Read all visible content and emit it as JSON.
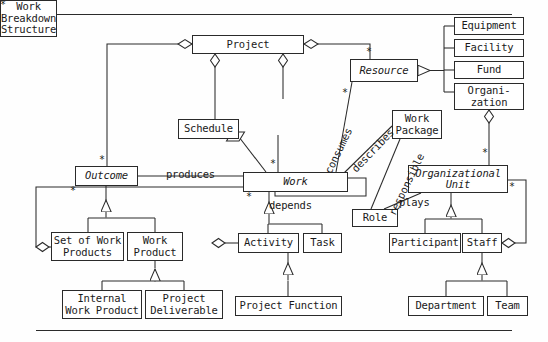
{
  "diagram": {
    "type": "uml-class-diagram",
    "classes": [
      {
        "id": "project",
        "label": "Project",
        "abstract": false,
        "x": 192,
        "y": 35,
        "w": 112,
        "h": 19
      },
      {
        "id": "equipment",
        "label": "Equipment",
        "abstract": false,
        "x": 454,
        "y": 17,
        "w": 70,
        "h": 18
      },
      {
        "id": "facility",
        "label": "Facility",
        "abstract": false,
        "x": 454,
        "y": 39,
        "w": 70,
        "h": 18
      },
      {
        "id": "fund",
        "label": "Fund",
        "abstract": false,
        "x": 454,
        "y": 61,
        "w": 70,
        "h": 18
      },
      {
        "id": "organization",
        "label": "Organi-\nzation",
        "abstract": false,
        "x": 454,
        "y": 83,
        "w": 70,
        "h": 27
      },
      {
        "id": "resource",
        "label": "Resource",
        "abstract": true,
        "x": 350,
        "y": 59,
        "w": 68,
        "h": 23
      },
      {
        "id": "work-breakdown",
        "label": "Work\nBreakdown\nStructure",
        "abstract": false,
        "x": 249,
        "y": 99,
        "w": 68,
        "h": 36
      },
      {
        "id": "schedule",
        "label": "Schedule",
        "abstract": false,
        "x": 178,
        "y": 119,
        "w": 61,
        "h": 20
      },
      {
        "id": "work-package",
        "label": "Work\nPackage",
        "abstract": false,
        "x": 392,
        "y": 110,
        "w": 50,
        "h": 29
      },
      {
        "id": "outcome",
        "label": "Outcome",
        "abstract": true,
        "x": 75,
        "y": 166,
        "w": 63,
        "h": 20
      },
      {
        "id": "work",
        "label": "Work",
        "abstract": true,
        "x": 243,
        "y": 172,
        "w": 105,
        "h": 20
      },
      {
        "id": "organizational-unit",
        "label": "Organizational\nUnit",
        "abstract": true,
        "x": 408,
        "y": 165,
        "w": 100,
        "h": 28
      },
      {
        "id": "role",
        "label": "Role",
        "abstract": false,
        "x": 352,
        "y": 209,
        "w": 46,
        "h": 18
      },
      {
        "id": "set-of-work-products",
        "label": "Set of Work\nProducts",
        "abstract": false,
        "x": 51,
        "y": 232,
        "w": 73,
        "h": 29
      },
      {
        "id": "work-product",
        "label": "Work\nProduct",
        "abstract": false,
        "x": 127,
        "y": 232,
        "w": 56,
        "h": 29
      },
      {
        "id": "activity",
        "label": "Activity",
        "abstract": false,
        "x": 238,
        "y": 233,
        "w": 61,
        "h": 20
      },
      {
        "id": "task",
        "label": "Task",
        "abstract": false,
        "x": 303,
        "y": 233,
        "w": 39,
        "h": 20
      },
      {
        "id": "participant",
        "label": "Participant",
        "abstract": false,
        "x": 389,
        "y": 233,
        "w": 72,
        "h": 20
      },
      {
        "id": "staff",
        "label": "Staff",
        "abstract": false,
        "x": 462,
        "y": 233,
        "w": 40,
        "h": 20
      },
      {
        "id": "internal-work-product",
        "label": "Internal\nWork Product",
        "abstract": false,
        "x": 62,
        "y": 290,
        "w": 80,
        "h": 29
      },
      {
        "id": "project-deliverable",
        "label": "Project\nDeliverable",
        "abstract": false,
        "x": 145,
        "y": 290,
        "w": 78,
        "h": 29
      },
      {
        "id": "project-function",
        "label": "Project Function",
        "abstract": false,
        "x": 235,
        "y": 296,
        "w": 107,
        "h": 20
      },
      {
        "id": "department",
        "label": "Department",
        "abstract": false,
        "x": 408,
        "y": 296,
        "w": 76,
        "h": 20
      },
      {
        "id": "team",
        "label": "Team",
        "abstract": false,
        "x": 487,
        "y": 296,
        "w": 41,
        "h": 20
      }
    ],
    "association_labels": [
      {
        "id": "produces",
        "text": "produces",
        "x": 166,
        "y": 168,
        "rotation": 0
      },
      {
        "id": "depends",
        "text": "depends",
        "x": 269,
        "y": 199,
        "rotation": 0
      },
      {
        "id": "plays",
        "text": "plays",
        "x": 399,
        "y": 196,
        "rotation": 0
      },
      {
        "id": "consumes",
        "text": "consumes",
        "x": 322,
        "y": 170,
        "rotation": -64
      },
      {
        "id": "describes",
        "text": "describes",
        "x": 349,
        "y": 166,
        "rotation": -46
      },
      {
        "id": "responsible",
        "text": "responsible",
        "x": 386,
        "y": 212,
        "rotation": -64
      }
    ],
    "multiplicities": [
      {
        "id": "mult-project-resource",
        "text": "*",
        "x": 366,
        "y": 47
      },
      {
        "id": "mult-resource-consumes",
        "text": "*",
        "x": 342,
        "y": 88
      },
      {
        "id": "mult-wbs-work",
        "text": "*",
        "x": 270,
        "y": 159
      },
      {
        "id": "mult-outcome-top",
        "text": "*",
        "x": 99,
        "y": 155
      },
      {
        "id": "mult-outcome-left",
        "text": "*",
        "x": 70,
        "y": 186
      },
      {
        "id": "mult-work-left",
        "text": "*",
        "x": 246,
        "y": 192
      },
      {
        "id": "mult-workpackage",
        "text": "*",
        "x": 444,
        "y": 141
      },
      {
        "id": "mult-org-unit-top",
        "text": "*",
        "x": 482,
        "y": 148
      },
      {
        "id": "mult-org-unit-right",
        "text": "*",
        "x": 509,
        "y": 182
      }
    ],
    "rules": [
      {
        "id": "rule-top",
        "y": 14
      },
      {
        "id": "rule-bottom",
        "y": 330
      }
    ],
    "colors": {
      "line": "#2a2a2a",
      "box_fill": "#ffffff",
      "text": "#1a1a1a",
      "background": "#fefefe"
    }
  }
}
